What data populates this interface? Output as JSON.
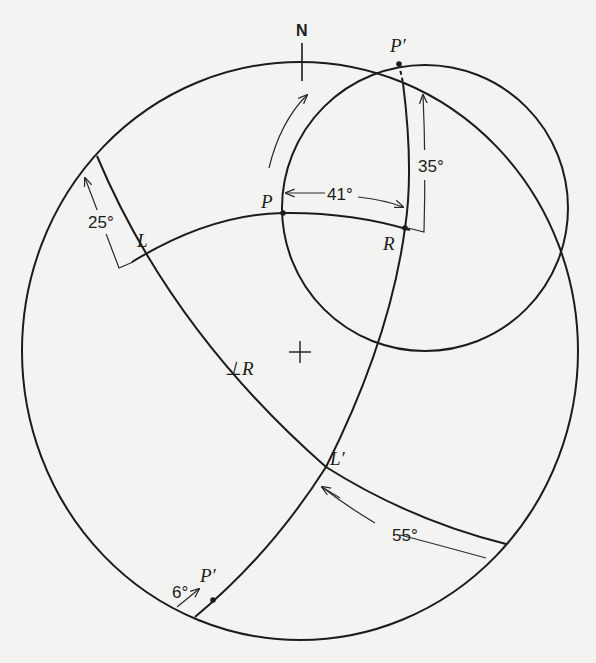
{
  "diagram": {
    "type": "stereographic-projection",
    "north_label": "N",
    "center_marker": "+",
    "points": {
      "P": "P",
      "P_prime_top": "P′",
      "P_prime_bottom": "P′",
      "R": "R",
      "L": "L",
      "L_prime": "L′",
      "perp_R": "⊥R"
    },
    "angles": {
      "a41": "41°",
      "a35": "35°",
      "a25": "25°",
      "a55": "55°",
      "a6": "6°"
    },
    "colors": {
      "background": "#f3f3f1",
      "ink": "#1c1c1c"
    }
  }
}
